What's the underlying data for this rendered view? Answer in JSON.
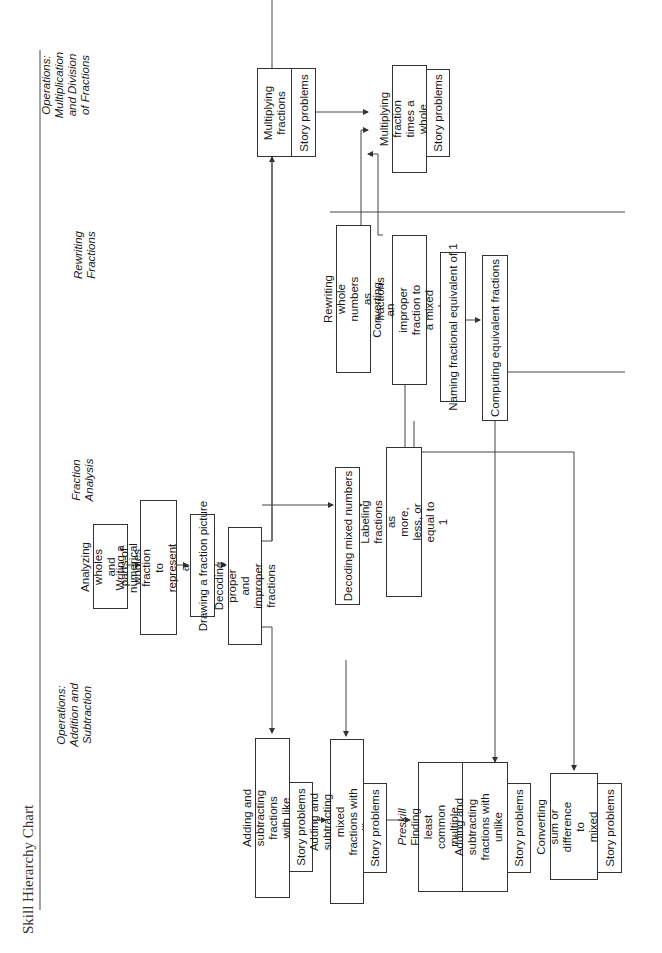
{
  "title": "Skill Hierarchy Chart",
  "columns": {
    "addition": "Operations:\nAddition and\nSubtraction",
    "analysis": "Fraction\nAnalysis",
    "rewriting": "Rewriting\nFractions",
    "multiplication": "Operations:\nMultiplication\nand Division\nof Fractions"
  },
  "nodes": {
    "analyzing_wholes": "Analyzing wholes and\nparts of wholes",
    "writing_numerical": "Writing a numerical\nfraction to represent a diagram",
    "drawing_picture": "Drawing a fraction picture",
    "decoding_proper": "Decoding proper and\nimproper fractions",
    "decoding_mixed": "Decoding mixed numbers",
    "labeling_fractions": "Labeling fractions as more,\nless, or equal to 1",
    "add_sub_like": "Adding and subtracting fractions\nwith like denominators",
    "add_sub_mixed": "Adding and subtracting mixed\nfractions with like denominators",
    "preskill_label": "Preskill",
    "preskill_lcm": "Finding least common\nmultiple of a number",
    "add_sub_unlike": "Adding and subtracting\nfractions with unlike\ndenominators",
    "converting_sum": "Converting sum or\ndifference to\nmixed number",
    "rewriting_whole": "Rewriting whole numbers\nas fractions",
    "converting_improper": "Converting an improper\nfraction to a mixed number",
    "naming_equivalent": "Naming fractional equivalent of 1",
    "computing_equivalent": "Computing equivalent fractions",
    "multiplying_fractions": "Multiplying\nfractions",
    "multiplying_whole": "Multiplying fraction\ntimes a whole number",
    "story_problems": "Story problems"
  }
}
